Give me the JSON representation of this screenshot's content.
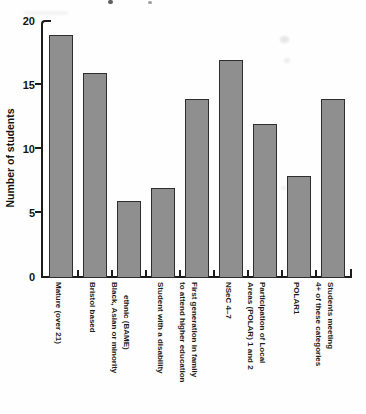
{
  "chart_data": {
    "type": "bar",
    "title": "",
    "xlabel": "",
    "ylabel": "Number of students",
    "ylim": [
      0,
      20
    ],
    "yticks": [
      0,
      5,
      10,
      15,
      20
    ],
    "grid": false,
    "legend": false,
    "bar_color": "#8f8f8f",
    "bar_border_color": "#2e2e2e",
    "categories": [
      "Mature (over 21)",
      "Bristol based",
      "Black, Asian or minority ethnic (BAME)",
      "Student with a disability",
      "First generation in family to attend higher education",
      "NSeC 4–7",
      "Participation of Local Areas (POLAR) 1 and 2",
      "POLAR1",
      "Students meeting 4+ of these categories"
    ],
    "values": [
      19,
      16,
      6,
      7,
      14,
      17,
      12,
      8,
      14
    ],
    "category_label_columns": [
      [
        {
          "text": "Mature (over 21)"
        }
      ],
      [
        {
          "text": "Bristol based"
        }
      ],
      [
        {
          "text": "Black, Asian or minority"
        },
        {
          "text": "ethnic (BAME)",
          "dy": 13
        }
      ],
      [
        {
          "text": "Student with a disability"
        }
      ],
      [
        {
          "text": "to attend higher education"
        },
        {
          "text": "First generation in family"
        }
      ],
      [
        {
          "text": "NSeC 4–7"
        }
      ],
      [
        {
          "text": "Areas (POLAR) 1 and 2"
        },
        {
          "text": "Participation of Local"
        }
      ],
      [
        {
          "text": "POLAR1"
        }
      ],
      [
        {
          "text": "4+ of these categories"
        },
        {
          "text": "Students meeting"
        }
      ]
    ]
  }
}
